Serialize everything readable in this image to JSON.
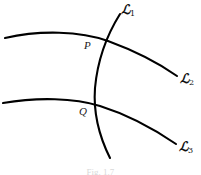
{
  "figure": {
    "caption": "Fig. 1.7",
    "background_color": "#ffffff",
    "stroke_color": "#000000",
    "labels": {
      "curve_1": {
        "symbol": "ℒ",
        "subscript": "1"
      },
      "curve_2": {
        "symbol": "ℒ",
        "subscript": "2"
      },
      "curve_3": {
        "symbol": "ℒ",
        "subscript": "3"
      },
      "point_p": "P",
      "point_q": "Q"
    },
    "geometry": {
      "curve_1": {
        "name": "L1",
        "description": "near-vertical arc bowing left, crossing both horizontal arcs",
        "path": "M 120 14 C 110 30, 98 55, 95 88 C 93 115, 101 140, 110 158",
        "stroke_width": 2.1,
        "endpoints": [
          [
            120,
            14
          ],
          [
            110,
            158
          ]
        ]
      },
      "curve_2": {
        "name": "L2",
        "description": "upper horizontal arc, rising slightly then falling to lower right",
        "path": "M 5 38 C 40 30, 80 31, 108 41 C 138 52, 160 64, 177 76",
        "stroke_width": 2.1,
        "endpoints": [
          [
            5,
            38
          ],
          [
            177,
            76
          ]
        ]
      },
      "curve_3": {
        "name": "L3",
        "description": "lower horizontal arc, rising slightly then falling to lower right",
        "path": "M 3 103 C 38 97, 74 98, 100 106 C 132 116, 157 131, 176 144",
        "stroke_width": 2.1,
        "endpoints": [
          [
            3,
            103
          ],
          [
            176,
            144
          ]
        ]
      },
      "intersections": [
        {
          "label": "P",
          "x": 99,
          "y": 39,
          "curves": [
            "L1",
            "L2"
          ]
        },
        {
          "label": "Q",
          "x": 94,
          "y": 104,
          "curves": [
            "L1",
            "L3"
          ]
        }
      ]
    }
  }
}
